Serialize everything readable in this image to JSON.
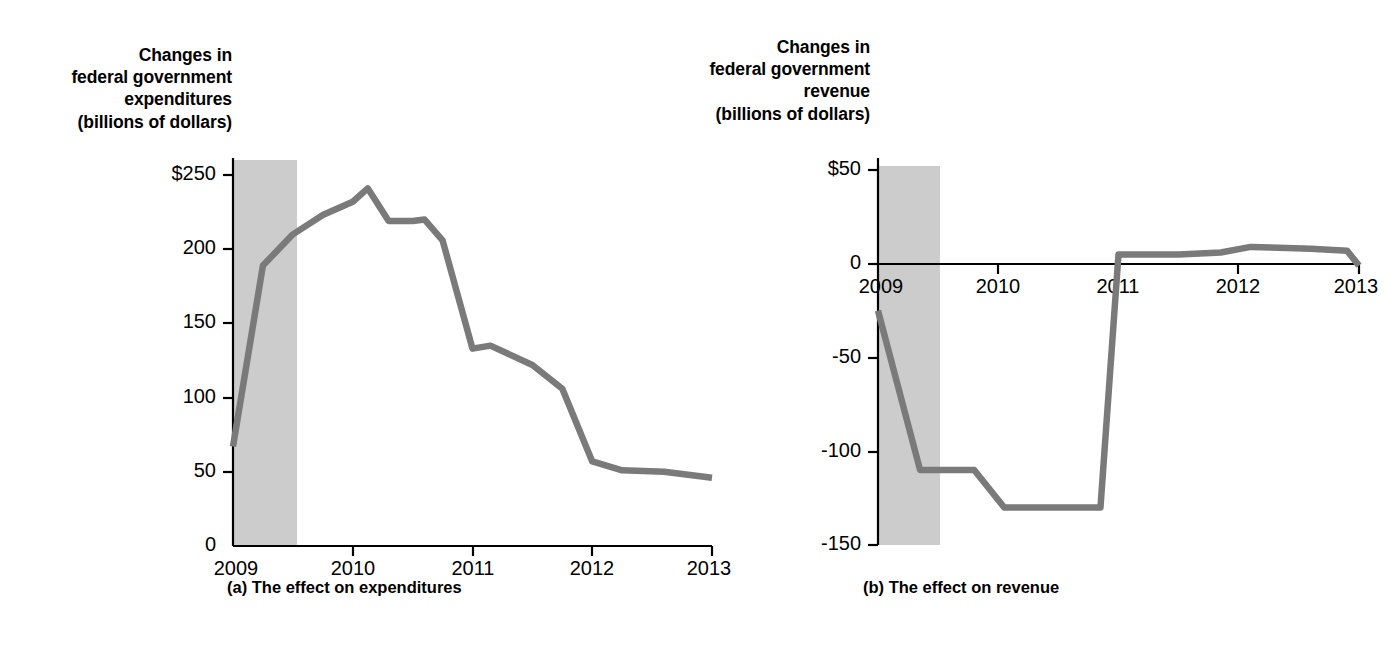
{
  "figure": {
    "panel_a": {
      "axis_title": "Changes in\nfederal government\nexpenditures\n(billions of dollars)",
      "axis_title_lines": [
        "Changes in",
        "federal government",
        "expenditures",
        "(billions of dollars)"
      ],
      "caption": "(a) The effect on expenditures"
    },
    "panel_b": {
      "axis_title_lines": [
        "Changes in",
        "federal government",
        "revenue",
        "(billions of dollars)"
      ],
      "caption": "(b) The effect on revenue"
    },
    "colors": {
      "line": "#7a7a7a",
      "recession_band": "#cccccc",
      "axis": "#000000",
      "background": "#ffffff"
    }
  },
  "chart_data": [
    {
      "type": "line",
      "id": "effect-on-expenditures",
      "title": "",
      "ylabel": "Changes in federal government expenditures (billions of dollars)",
      "xlabel": "",
      "ylim": [
        0,
        250
      ],
      "xlim": [
        2009,
        2013
      ],
      "yticks": [
        0,
        50,
        100,
        150,
        200,
        250
      ],
      "ytick_labels": [
        "0",
        "50",
        "100",
        "150",
        "200",
        "$250"
      ],
      "xticks": [
        2009,
        2010,
        2011,
        2012,
        2013
      ],
      "xtick_labels": [
        "2009",
        "2010",
        "2011",
        "2012",
        "2013"
      ],
      "grid": false,
      "legend": "none",
      "shaded_region": {
        "label": "recession",
        "x_start": 2009.0,
        "x_end": 2009.5
      },
      "x": [
        2009.0,
        2009.25,
        2009.5,
        2009.75,
        2010.0,
        2010.125,
        2010.3,
        2010.5,
        2010.6,
        2010.75,
        2011.0,
        2011.15,
        2011.5,
        2011.75,
        2012.0,
        2012.25,
        2012.6,
        2013.0
      ],
      "values": [
        67,
        189,
        210,
        223,
        232,
        241,
        219,
        219,
        220,
        206,
        133,
        135,
        122,
        106,
        57,
        51,
        50,
        46
      ]
    },
    {
      "type": "line",
      "id": "effect-on-revenue",
      "title": "",
      "ylabel": "Changes in federal government revenue (billions of dollars)",
      "xlabel": "",
      "ylim": [
        -150,
        50
      ],
      "xlim": [
        2009,
        2013
      ],
      "yticks": [
        -150,
        -100,
        -50,
        0,
        50
      ],
      "ytick_labels": [
        "-150",
        "-100",
        "-50",
        "0",
        "$50"
      ],
      "xticks": [
        2009,
        2010,
        2011,
        2012,
        2013
      ],
      "xtick_labels": [
        "2009",
        "2010",
        "2011",
        "2012",
        "2013"
      ],
      "grid": false,
      "legend": "none",
      "zero_line": true,
      "shaded_region": {
        "label": "recession",
        "x_start": 2009.0,
        "x_end": 2009.5
      },
      "x": [
        2009.0,
        2009.35,
        2009.6,
        2009.8,
        2010.05,
        2010.85,
        2011.0,
        2011.5,
        2011.85,
        2012.1,
        2012.6,
        2012.9,
        2013.0
      ],
      "values": [
        -25,
        -110,
        -110,
        -110,
        -130,
        -130,
        5,
        5,
        6,
        9,
        8,
        7,
        -1
      ]
    }
  ]
}
